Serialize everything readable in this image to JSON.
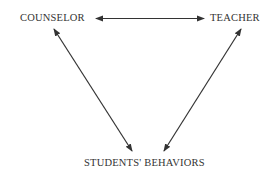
{
  "nodes": {
    "counselor": "COUNSELOR",
    "teacher": "TEACHER",
    "students": "STUDENTS' BEHAVIORS"
  },
  "edges": [
    {
      "from": "counselor",
      "to": "teacher",
      "type": "bidirectional"
    },
    {
      "from": "counselor",
      "to": "students",
      "type": "bidirectional"
    },
    {
      "from": "teacher",
      "to": "students",
      "type": "bidirectional"
    }
  ],
  "colors": {
    "line": "#333333",
    "text": "#333333"
  }
}
